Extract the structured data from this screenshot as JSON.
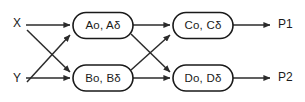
{
  "diagram": {
    "stroke_color": "#2b2b2b",
    "node_border_color": "#1a1a1a",
    "node_fill_color": "#ffffff",
    "background_color": "#ffffff",
    "inputs": [
      {
        "id": "X",
        "label": "X"
      },
      {
        "id": "Y",
        "label": "Y"
      }
    ],
    "nodes": [
      {
        "id": "A",
        "label": "Ao, Aδ"
      },
      {
        "id": "C",
        "label": "Co, Cδ"
      },
      {
        "id": "B",
        "label": "Bo, Bδ"
      },
      {
        "id": "D",
        "label": "Do, Dδ"
      }
    ],
    "outputs": [
      {
        "id": "P1",
        "label": "P1"
      },
      {
        "id": "P2",
        "label": "P2"
      }
    ],
    "edges": [
      {
        "from": "X",
        "to": "A"
      },
      {
        "from": "X",
        "to": "B"
      },
      {
        "from": "Y",
        "to": "A"
      },
      {
        "from": "Y",
        "to": "B"
      },
      {
        "from": "A",
        "to": "C"
      },
      {
        "from": "A",
        "to": "D"
      },
      {
        "from": "B",
        "to": "C"
      },
      {
        "from": "B",
        "to": "D"
      },
      {
        "from": "C",
        "to": "P1"
      },
      {
        "from": "D",
        "to": "P2"
      }
    ]
  }
}
